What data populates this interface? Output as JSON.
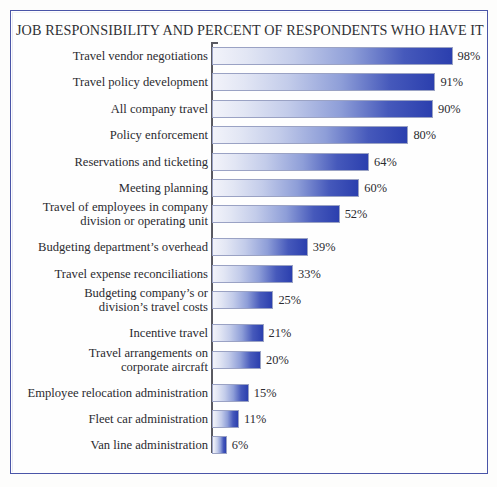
{
  "chart_data": {
    "type": "bar",
    "orientation": "horizontal",
    "title": "JOB RESPONSIBILITY AND PERCENT OF RESPONDENTS WHO HAVE IT",
    "xlabel": "",
    "ylabel": "",
    "xlim": [
      0,
      100
    ],
    "grid": false,
    "legend": false,
    "value_suffix": "%",
    "categories": [
      "Travel vendor negotiations",
      "Travel policy development",
      "All company travel",
      "Policy enforcement",
      "Reservations and ticketing",
      "Meeting planning",
      "Travel of employees in company\ndivision or operating unit",
      "Budgeting department’s overhead",
      "Travel expense reconciliations",
      "Budgeting company’s or\ndivision’s travel costs",
      "Incentive travel",
      "Travel arrangements on\ncorporate aircraft",
      "Employee relocation administration",
      "Fleet car administration",
      "Van line administration"
    ],
    "values": [
      98,
      91,
      90,
      80,
      64,
      60,
      52,
      39,
      33,
      25,
      21,
      20,
      15,
      11,
      6
    ],
    "value_labels": [
      "98%",
      "91%",
      "90%",
      "80%",
      "64%",
      "60%",
      "52%",
      "39%",
      "33%",
      "25%",
      "21%",
      "20%",
      "15%",
      "11%",
      "6%"
    ]
  },
  "colors": {
    "frame_border": "#4a55a8",
    "bar_start": "#f2f3fa",
    "bar_end": "#2b3fae",
    "axis": "#5a5a62",
    "text": "#2b2b30",
    "background": "#fdfdfc"
  }
}
